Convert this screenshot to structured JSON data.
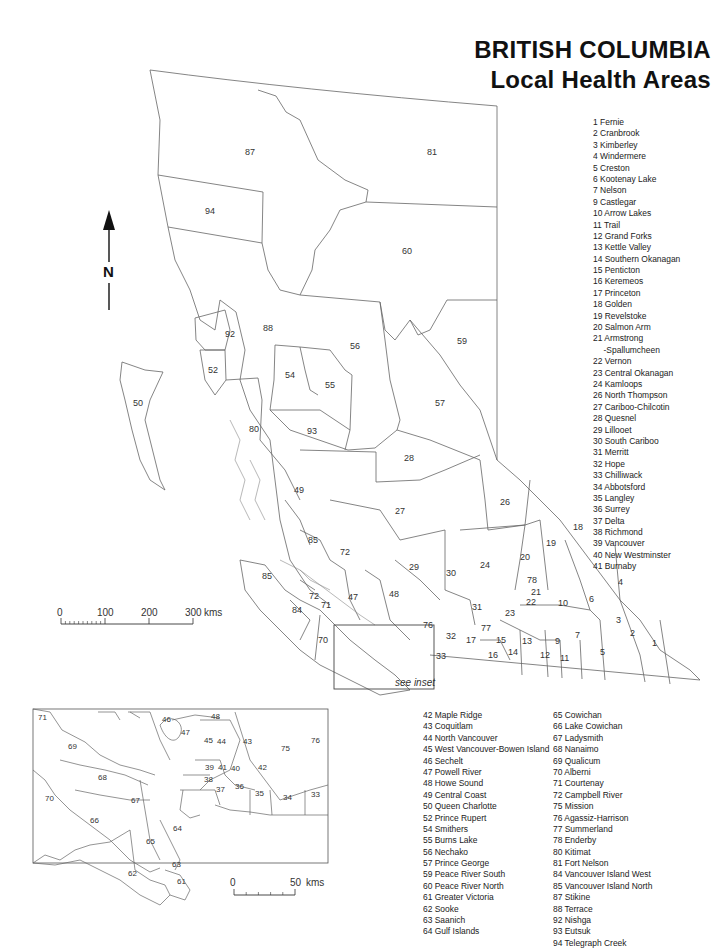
{
  "title": {
    "line1": "BRITISH COLUMBIA",
    "line2": "Local Health Areas"
  },
  "north_arrow": {
    "label": "N",
    "icon": "north-arrow-icon"
  },
  "main_scale": {
    "ticks": [
      "0",
      "100",
      "200",
      "300"
    ],
    "unit": "kms"
  },
  "inset_scale": {
    "ticks": [
      "0",
      "50"
    ],
    "unit": "kms"
  },
  "inset_note": "see inset",
  "legend_a": [
    "1 Fernie",
    "2 Cranbrook",
    "3 Kimberley",
    "4 Windermere",
    "5 Creston",
    "6 Kootenay Lake",
    "7 Nelson",
    "9 Castlegar",
    "10 Arrow Lakes",
    "11 Trail",
    "12 Grand Forks",
    "13 Kettle Valley",
    "14 Southern Okanagan",
    "15 Penticton",
    "16 Keremeos",
    "17 Princeton",
    "18 Golden",
    "19 Revelstoke",
    "20 Salmon Arm",
    "21 Armstrong",
    "-Spallumcheen",
    "22 Vernon",
    "23 Central Okanagan",
    "24 Kamloops",
    "26 North Thompson",
    "27 Cariboo-Chilcotin",
    "28 Quesnel",
    "29 Lillooet",
    "30 South Cariboo",
    "31 Merritt",
    "32 Hope",
    "33 Chilliwack",
    "34 Abbotsford",
    "35 Langley",
    "36 Surrey",
    "37 Delta",
    "38 Richmond",
    "39 Vancouver",
    "40 New Westminster",
    "41 Burnaby"
  ],
  "legend_b": [
    "42 Maple Ridge",
    "43 Coquitlam",
    "44 North Vancouver",
    "45 West Vancouver-Bowen Island",
    "46 Sechelt",
    "47 Powell River",
    "48 Howe Sound",
    "49 Central Coast",
    "50 Queen Charlotte",
    "52 Prince Rupert",
    "54 Smithers",
    "55 Burns Lake",
    "56 Nechako",
    "57 Prince George",
    "59 Peace River South",
    "60 Peace River North",
    "61 Greater Victoria",
    "62 Sooke",
    "63 Saanich",
    "64 Gulf Islands"
  ],
  "legend_c": [
    "65 Cowichan",
    "66 Lake Cowichan",
    "67 Ladysmith",
    "68 Nanaimo",
    "69 Qualicum",
    "70 Alberni",
    "71 Courtenay",
    "72 Campbell River",
    "75 Mission",
    "76 Agassiz-Harrison",
    "77 Summerland",
    "78 Enderby",
    "80 Kitimat",
    "81 Fort Nelson",
    "84 Vancouver Island West",
    "85 Vancouver Island North",
    "87 Stikine",
    "88 Terrace",
    "92 Nishga",
    "93 Eutsuk",
    "94 Telegraph Creek"
  ],
  "map_labels": {
    "81": "81",
    "87": "87",
    "94": "94",
    "60": "60",
    "92": "92",
    "88": "88",
    "52": "52",
    "56": "56",
    "59": "59",
    "54": "54",
    "55": "55",
    "50": "50",
    "57": "57",
    "80": "80",
    "93": "93",
    "28": "28",
    "49": "49",
    "26": "26",
    "27": "27",
    "18": "18",
    "85a": "85",
    "72a": "72",
    "19": "19",
    "20": "20",
    "4": "4",
    "29": "29",
    "30": "30",
    "24": "24",
    "78": "78",
    "85b": "85",
    "72b": "72",
    "47": "47",
    "48": "48",
    "21": "21",
    "22": "22",
    "10": "10",
    "6": "6",
    "84": "84",
    "71": "71",
    "31": "31",
    "23": "23",
    "3": "3",
    "76": "76",
    "70": "70",
    "32": "32",
    "77": "77",
    "15": "15",
    "13": "13",
    "9": "9",
    "7": "7",
    "2": "2",
    "33": "33",
    "17": "17",
    "14": "14",
    "16": "16",
    "12": "12",
    "11": "11",
    "5": "5",
    "1": "1"
  },
  "inset_labels": {
    "71": "71",
    "46": "46",
    "48": "48",
    "47": "47",
    "45": "45",
    "44": "44",
    "43": "43",
    "75": "75",
    "76": "76",
    "69": "69",
    "68": "68",
    "42": "42",
    "39": "39",
    "41": "41",
    "40": "40",
    "38": "38",
    "37": "37",
    "36": "36",
    "35": "35",
    "34": "34",
    "33": "33",
    "70": "70",
    "67": "67",
    "66": "66",
    "64": "64",
    "65": "65",
    "63": "63",
    "62": "62",
    "61": "61"
  }
}
